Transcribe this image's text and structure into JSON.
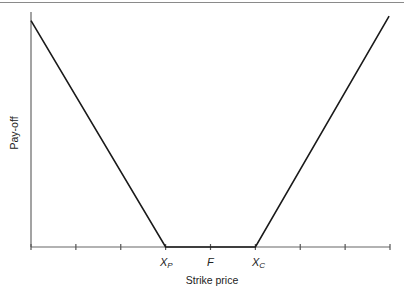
{
  "chart_data": {
    "type": "line",
    "title": "",
    "xlabel": "Strike price",
    "ylabel": "Pay-off",
    "tick_positions": [
      0,
      1,
      2,
      3,
      4,
      5,
      6,
      7,
      8
    ],
    "tick_labels": [
      {
        "pos": 3,
        "main": "X",
        "sub": "P"
      },
      {
        "pos": 4,
        "main": "F",
        "sub": ""
      },
      {
        "pos": 5,
        "main": "X",
        "sub": "C"
      }
    ],
    "xlim": [
      0,
      8
    ],
    "ylim": [
      0,
      4.6
    ],
    "grid": false,
    "legend": null,
    "series": [
      {
        "name": "Straddle/strangle pay-off",
        "x": [
          0,
          3,
          5,
          7.98
        ],
        "y": [
          4.43,
          0,
          0,
          4.52
        ]
      }
    ],
    "colors": {
      "line": "#1a1a1a",
      "axis": "#555555"
    }
  },
  "labels": {
    "ylabel": "Pay-off",
    "xlabel": "Strike price",
    "xp_main": "X",
    "xp_sub": "P",
    "f_main": "F",
    "xc_main": "X",
    "xc_sub": "C"
  }
}
